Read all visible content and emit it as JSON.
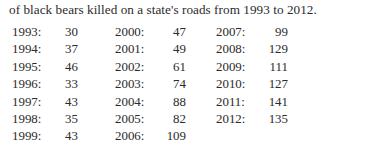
{
  "caption": "of black bears killed on a state's roads from 1993 to 2012.",
  "chart_data": {
    "type": "table",
    "title": "of black bears killed on a state's roads from 1993 to 2012.",
    "xlabel": "Year",
    "ylabel": "Black bears killed",
    "categories": [
      "1993",
      "1994",
      "1995",
      "1996",
      "1997",
      "1998",
      "1999",
      "2000",
      "2001",
      "2002",
      "2003",
      "2004",
      "2005",
      "2006",
      "2007",
      "2008",
      "2009",
      "2010",
      "2011",
      "2012"
    ],
    "values": [
      30,
      37,
      46,
      33,
      43,
      35,
      43,
      47,
      49,
      61,
      74,
      88,
      82,
      109,
      99,
      129,
      111,
      127,
      141,
      135
    ]
  },
  "table": {
    "rows": [
      {
        "c1": {
          "year": "1993:",
          "value": "30"
        },
        "c2": {
          "year": "2000:",
          "value": "47"
        },
        "c3": {
          "year": "2007:",
          "value": "99"
        }
      },
      {
        "c1": {
          "year": "1994:",
          "value": "37"
        },
        "c2": {
          "year": "2001:",
          "value": "49"
        },
        "c3": {
          "year": "2008:",
          "value": "129"
        }
      },
      {
        "c1": {
          "year": "1995:",
          "value": "46"
        },
        "c2": {
          "year": "2002:",
          "value": "61"
        },
        "c3": {
          "year": "2009:",
          "value": "111"
        }
      },
      {
        "c1": {
          "year": "1996:",
          "value": "33"
        },
        "c2": {
          "year": "2003:",
          "value": "74"
        },
        "c3": {
          "year": "2010:",
          "value": "127"
        }
      },
      {
        "c1": {
          "year": "1997:",
          "value": "43"
        },
        "c2": {
          "year": "2004:",
          "value": "88"
        },
        "c3": {
          "year": "2011:",
          "value": "141"
        }
      },
      {
        "c1": {
          "year": "1998:",
          "value": "35"
        },
        "c2": {
          "year": "2005:",
          "value": "82"
        },
        "c3": {
          "year": "2012:",
          "value": "135"
        }
      },
      {
        "c1": {
          "year": "1999:",
          "value": "43"
        },
        "c2": {
          "year": "2006:",
          "value": "109"
        },
        "c3": {
          "year": "",
          "value": ""
        }
      }
    ]
  }
}
